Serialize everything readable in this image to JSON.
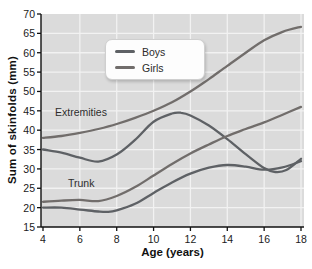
{
  "chart_data": {
    "type": "line",
    "title": "",
    "xlabel": "Age (years)",
    "ylabel": "Sum of skinfolds (mm)",
    "xlim": [
      4,
      18
    ],
    "ylim": [
      15,
      70
    ],
    "x_ticks": [
      4,
      6,
      8,
      10,
      12,
      14,
      16,
      18
    ],
    "y_ticks": [
      15,
      20,
      25,
      30,
      35,
      40,
      45,
      50,
      55,
      60,
      65,
      70
    ],
    "grid": true,
    "plot_background": "#dbdbdb",
    "gridline_color": "#f2f2f2",
    "axis_color": "#111111",
    "legend_position": "top-center",
    "legend": [
      {
        "label": "Boys",
        "color": "#5e6165"
      },
      {
        "label": "Girls",
        "color": "#716d6b"
      }
    ],
    "annotations": [
      {
        "text": "Extremities",
        "x": 6.1,
        "y": 43.5
      },
      {
        "text": "Trunk",
        "x": 6.0,
        "y": 25.0
      }
    ],
    "series": [
      {
        "name": "Girls extremities",
        "group": "Girls",
        "region": "Extremities",
        "color": "#716d6b",
        "x": [
          4,
          5,
          6,
          7,
          8,
          9,
          10,
          11,
          12,
          13,
          14,
          15,
          16,
          17,
          18
        ],
        "y": [
          38,
          38.5,
          39.3,
          40.3,
          41.6,
          43.2,
          45,
          47.2,
          50,
          53.2,
          56.6,
          60,
          63.2,
          65.4,
          66.7
        ]
      },
      {
        "name": "Boys extremities",
        "group": "Boys",
        "region": "Extremities",
        "color": "#5e6165",
        "x": [
          4,
          5,
          6,
          7,
          8,
          9,
          10,
          11,
          11.5,
          12,
          13,
          14,
          15,
          16,
          16.6,
          17.2,
          18
        ],
        "y": [
          35,
          34.2,
          32.9,
          31.9,
          33.7,
          37.5,
          42.2,
          44.3,
          44.5,
          43.8,
          41.2,
          37.7,
          33.8,
          30.2,
          29.2,
          29.7,
          32.6
        ]
      },
      {
        "name": "Girls trunk",
        "group": "Girls",
        "region": "Trunk",
        "color": "#716d6b",
        "x": [
          4,
          5,
          6,
          7,
          8,
          9,
          10,
          11,
          12,
          13,
          14,
          15,
          16,
          17,
          18
        ],
        "y": [
          21.5,
          21.8,
          22,
          21.7,
          23,
          25.3,
          28.3,
          31.3,
          34,
          36.3,
          38.5,
          40.3,
          42,
          44,
          46
        ]
      },
      {
        "name": "Boys trunk",
        "group": "Boys",
        "region": "Trunk",
        "color": "#5e6165",
        "x": [
          4,
          5,
          6,
          7,
          7.5,
          8,
          9,
          10,
          11,
          12,
          13,
          14,
          15,
          16,
          17,
          18
        ],
        "y": [
          20,
          20,
          19.5,
          19,
          18.9,
          19.3,
          21,
          23.8,
          26.5,
          28.8,
          30.3,
          31,
          30.6,
          29.8,
          30.4,
          32
        ]
      }
    ]
  }
}
